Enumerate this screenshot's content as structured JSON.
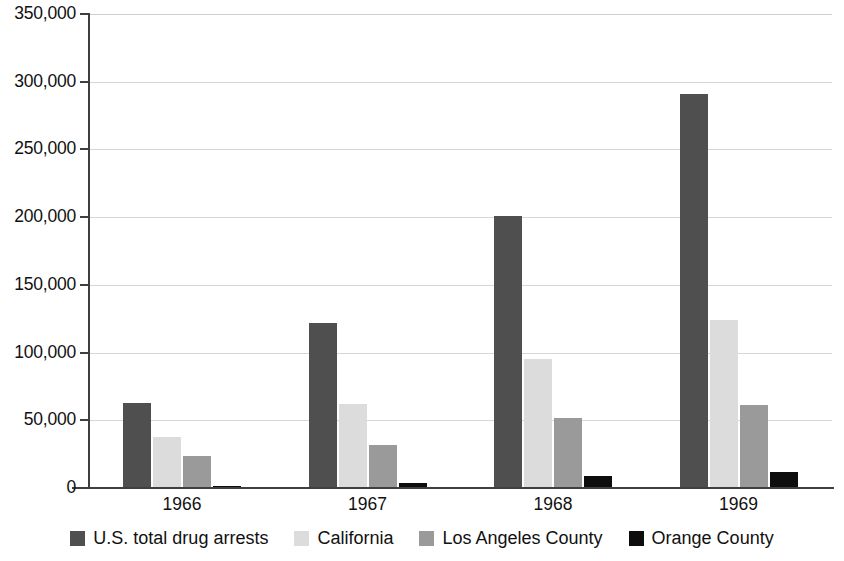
{
  "chart_data": {
    "type": "bar",
    "title": "",
    "xlabel": "",
    "ylabel": "",
    "categories": [
      "1966",
      "1967",
      "1968",
      "1969"
    ],
    "series": [
      {
        "name": "U.S. total drug arrests",
        "color": "#4f4f4f",
        "values": [
          62500,
          122000,
          201000,
          291000
        ]
      },
      {
        "name": "California",
        "color": "#dcdcdc",
        "values": [
          37500,
          62000,
          95000,
          124000
        ]
      },
      {
        "name": "Los Angeles County",
        "color": "#9a9a9a",
        "values": [
          23500,
          32000,
          52000,
          61500
        ]
      },
      {
        "name": "Orange County",
        "color": "#0d0d0d",
        "values": [
          1500,
          4000,
          9000,
          11500
        ]
      }
    ],
    "ylim": [
      0,
      350000
    ],
    "y_ticks": [
      0,
      50000,
      100000,
      150000,
      200000,
      250000,
      300000,
      350000
    ],
    "y_tick_labels": [
      "0",
      "50,000",
      "100,000",
      "150,000",
      "200,000",
      "250,000",
      "300,000",
      "350,000"
    ],
    "grid": true,
    "grid_axis": "y",
    "legend_position": "bottom"
  }
}
